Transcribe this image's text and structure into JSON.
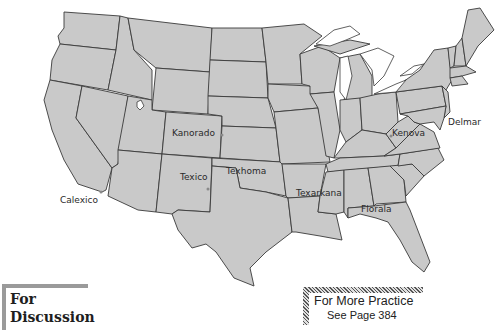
{
  "map": {
    "title": "United States border-name towns",
    "fill_color": "#c9c9c9",
    "stroke_color": "#3a3a3a",
    "labels": [
      {
        "name": "Kanorado",
        "x": 172,
        "y": 130
      },
      {
        "name": "Texico",
        "x": 180,
        "y": 173
      },
      {
        "name": "Texhoma",
        "x": 226,
        "y": 168
      },
      {
        "name": "Texarkana",
        "x": 296,
        "y": 189
      },
      {
        "name": "Florala",
        "x": 361,
        "y": 205
      },
      {
        "name": "Kenova",
        "x": 392,
        "y": 128
      },
      {
        "name": "Delmar",
        "x": 448,
        "y": 118
      },
      {
        "name": "Calexico",
        "x": 60,
        "y": 195
      }
    ]
  },
  "discussion_box": {
    "line1": "For",
    "line2": "Discussion"
  },
  "practice_box": {
    "title": "For More Practice",
    "subtitle": "See Page 384"
  }
}
